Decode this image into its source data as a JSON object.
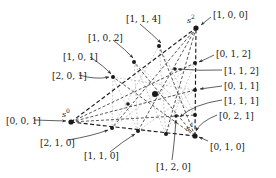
{
  "figure": {
    "background_color": "#ffffff",
    "ink_color": "#1a1a1a",
    "faint_color": "#9a9a9a"
  },
  "vertices": [
    {
      "name": "s0",
      "label": "s",
      "exponent": "0",
      "x": 71,
      "y": 122
    },
    {
      "name": "s1",
      "label": "s",
      "exponent": "1",
      "x": 195,
      "y": 136
    },
    {
      "name": "s2",
      "label": "s",
      "exponent": "2",
      "x": 196,
      "y": 28
    }
  ],
  "labels": [
    {
      "name": "label-1-1-4",
      "text": "[1, 1, 4]",
      "x": 126,
      "y": 15
    },
    {
      "name": "label-1-0-0",
      "text": "[1, 0, 0]",
      "x": 213,
      "y": 11
    },
    {
      "name": "label-1-0-2",
      "text": "[1, 0, 2]",
      "x": 88,
      "y": 34
    },
    {
      "name": "label-0-1-2",
      "text": "[0, 1, 2]",
      "x": 216,
      "y": 50
    },
    {
      "name": "label-1-0-1",
      "text": "[1, 0, 1]",
      "x": 63,
      "y": 53
    },
    {
      "name": "label-1-1-2",
      "text": "[1, 1, 2]",
      "x": 224,
      "y": 67
    },
    {
      "name": "label-2-0-1",
      "text": "[2, 0, 1]",
      "x": 52,
      "y": 72
    },
    {
      "name": "label-0-1-1",
      "text": "[0, 1, 1]",
      "x": 224,
      "y": 82
    },
    {
      "name": "label-1-1-1",
      "text": "[1, 1, 1]",
      "x": 224,
      "y": 97
    },
    {
      "name": "label-0-0-1",
      "text": "[0, 0, 1]",
      "x": 6,
      "y": 117
    },
    {
      "name": "label-0-2-1",
      "text": "[0, 2, 1]",
      "x": 219,
      "y": 112
    },
    {
      "name": "label-2-1-0",
      "text": "[2, 1, 0]",
      "x": 40,
      "y": 139
    },
    {
      "name": "label-0-1-0",
      "text": "[0, 1, 0]",
      "x": 210,
      "y": 143
    },
    {
      "name": "label-1-1-0",
      "text": "[1, 1, 0]",
      "x": 84,
      "y": 152
    },
    {
      "name": "label-1-2-0",
      "text": "[1, 2, 0]",
      "x": 156,
      "y": 163
    }
  ],
  "nodes": [
    {
      "name": "node-s0",
      "x": 71,
      "y": 122,
      "r": 2.6
    },
    {
      "name": "node-s1",
      "x": 195,
      "y": 136,
      "r": 2.6
    },
    {
      "name": "node-s2",
      "x": 196,
      "y": 28,
      "r": 2.6
    },
    {
      "name": "node-barycenter",
      "x": 155,
      "y": 94,
      "r": 3.0
    },
    {
      "name": "node-edge-02-a",
      "x": 113,
      "y": 77,
      "r": 2.0
    },
    {
      "name": "node-edge-02-b",
      "x": 134,
      "y": 62,
      "r": 2.0
    },
    {
      "name": "node-edge-02-c",
      "x": 159,
      "y": 46,
      "r": 2.0
    },
    {
      "name": "node-edge-01-a",
      "x": 112,
      "y": 128,
      "r": 2.0
    },
    {
      "name": "node-edge-01-b",
      "x": 138,
      "y": 131,
      "r": 2.0
    },
    {
      "name": "node-edge-01-c",
      "x": 166,
      "y": 134,
      "r": 2.0
    },
    {
      "name": "node-edge-12-a",
      "x": 195,
      "y": 63,
      "r": 2.0
    },
    {
      "name": "node-edge-12-b",
      "x": 195,
      "y": 90,
      "r": 2.0
    },
    {
      "name": "node-edge-12-c",
      "x": 195,
      "y": 115,
      "r": 2.0
    },
    {
      "name": "node-interior-a",
      "x": 128,
      "y": 104,
      "r": 1.8
    },
    {
      "name": "node-interior-b",
      "x": 175,
      "y": 69,
      "r": 1.8
    },
    {
      "name": "node-interior-c",
      "x": 176,
      "y": 116,
      "r": 1.8
    }
  ],
  "edges": {
    "outline": [
      {
        "name": "edge-s0-s2",
        "from": [
          71,
          122
        ],
        "to": [
          196,
          28
        ]
      },
      {
        "name": "edge-s0-s1",
        "from": [
          71,
          122
        ],
        "to": [
          195,
          136
        ]
      },
      {
        "name": "edge-s1-s2",
        "from": [
          195,
          136
        ],
        "to": [
          196,
          28
        ]
      }
    ],
    "medians": [
      {
        "name": "median-s0-bary",
        "from": [
          71,
          122
        ],
        "to": [
          195,
          63
        ]
      },
      {
        "name": "median-s2-bary",
        "from": [
          196,
          28
        ],
        "to": [
          138,
          131
        ]
      },
      {
        "name": "median-s1-bary",
        "from": [
          195,
          136
        ],
        "to": [
          113,
          77
        ]
      },
      {
        "name": "median-s0-mid12",
        "from": [
          71,
          122
        ],
        "to": [
          195,
          90
        ]
      },
      {
        "name": "median-s0-low",
        "from": [
          71,
          122
        ],
        "to": [
          195,
          115
        ]
      },
      {
        "name": "median-s2-left",
        "from": [
          196,
          28
        ],
        "to": [
          112,
          128
        ]
      },
      {
        "name": "median-s2-right",
        "from": [
          196,
          28
        ],
        "to": [
          166,
          134
        ]
      },
      {
        "name": "median-s1-up",
        "from": [
          195,
          136
        ],
        "to": [
          134,
          62
        ]
      },
      {
        "name": "median-s1-top",
        "from": [
          195,
          136
        ],
        "to": [
          159,
          46
        ]
      }
    ],
    "fine": [
      {
        "name": "fine-a",
        "from": [
          113,
          77
        ],
        "to": [
          138,
          131
        ]
      },
      {
        "name": "fine-b",
        "from": [
          134,
          62
        ],
        "to": [
          166,
          134
        ]
      },
      {
        "name": "fine-c",
        "from": [
          159,
          46
        ],
        "to": [
          195,
          115
        ]
      },
      {
        "name": "fine-d",
        "from": [
          112,
          128
        ],
        "to": [
          195,
          63
        ]
      },
      {
        "name": "fine-e",
        "from": [
          112,
          128
        ],
        "to": [
          159,
          46
        ]
      },
      {
        "name": "fine-f",
        "from": [
          138,
          131
        ],
        "to": [
          195,
          90
        ]
      },
      {
        "name": "fine-g",
        "from": [
          113,
          77
        ],
        "to": [
          195,
          90
        ]
      },
      {
        "name": "fine-h",
        "from": [
          134,
          62
        ],
        "to": [
          195,
          115
        ]
      },
      {
        "name": "fine-i",
        "from": [
          166,
          134
        ],
        "to": [
          195,
          63
        ]
      },
      {
        "name": "fine-j",
        "from": [
          113,
          77
        ],
        "to": [
          112,
          128
        ]
      },
      {
        "name": "fine-k",
        "from": [
          134,
          62
        ],
        "to": [
          138,
          131
        ]
      },
      {
        "name": "fine-l",
        "from": [
          159,
          46
        ],
        "to": [
          166,
          134
        ]
      }
    ]
  },
  "arrows": [
    {
      "name": "arrow-1-0-0",
      "path": "M 211 17 L 201 25"
    },
    {
      "name": "arrow-1-1-4",
      "path": "M 140 24 Q 152 34 161 43"
    },
    {
      "name": "arrow-1-0-2",
      "path": "M 113 40 Q 126 50 133 58"
    },
    {
      "name": "arrow-0-1-2",
      "path": "M 214 55 Q 204 60 199 62"
    },
    {
      "name": "arrow-1-0-1",
      "path": "M 90 57 Q 104 66 111 74"
    },
    {
      "name": "arrow-1-1-2",
      "path": "M 222 70 Q 200 71 178 69"
    },
    {
      "name": "arrow-2-0-1",
      "path": "M 79 75 Q 96 80 109 77"
    },
    {
      "name": "arrow-0-1-1",
      "path": "M 222 86 L 200 89"
    },
    {
      "name": "arrow-1-1-1",
      "path": "M 222 100 Q 194 104 180 117"
    },
    {
      "name": "arrow-0-0-1",
      "path": "M 34 120 L 66 121"
    },
    {
      "name": "arrow-0-2-1",
      "path": "M 217 115 Q 200 122 196 131"
    },
    {
      "name": "arrow-2-1-0",
      "path": "M 68 140 Q 92 136 108 130"
    },
    {
      "name": "arrow-0-1-0",
      "path": "M 208 141 L 199 137"
    },
    {
      "name": "arrow-1-1-0",
      "path": "M 110 152 Q 122 142 135 134"
    },
    {
      "name": "arrow-1-2-0",
      "path": "M 172 160 Q 174 146 176 120"
    }
  ]
}
